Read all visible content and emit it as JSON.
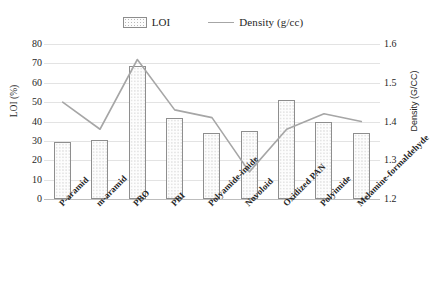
{
  "legend": {
    "position": "top-center",
    "entries": [
      {
        "label": "LOI",
        "type": "bar",
        "marker": "bar-swatch-icon"
      },
      {
        "label": "Density (g/cc)",
        "type": "line",
        "marker": "line-swatch-icon"
      }
    ]
  },
  "axes": {
    "left_title": "LOI (%)",
    "right_title": "Density (G/CC)",
    "left_ticks": [
      "80",
      "70",
      "60",
      "50",
      "40",
      "30",
      "20",
      "10",
      "0"
    ],
    "right_ticks": [
      "1.6",
      "1.5",
      "1.4",
      "1.3",
      "1.2"
    ]
  },
  "chart_data": {
    "type": "bar",
    "title": "",
    "xlabel": "",
    "ylabel": "LOI (%)",
    "y2label": "Density (G/CC)",
    "ylim": [
      0,
      80
    ],
    "y2lim": [
      1.2,
      1.6
    ],
    "grid": true,
    "legend_position": "top-center",
    "categories": [
      "P-aramid",
      "m-aramid",
      "PBO",
      "PBI",
      "Polyamide-imide",
      "Novoloid",
      "Oxidized PAN",
      "Polyimide",
      "Melamine-formaldehyde"
    ],
    "series": [
      {
        "name": "LOI",
        "type": "bar",
        "axis": "left",
        "unit": "%",
        "values": [
          29.5,
          30.5,
          68.5,
          42,
          34,
          35,
          51,
          40,
          34
        ]
      },
      {
        "name": "Density (g/cc)",
        "type": "line",
        "axis": "right",
        "unit": "g/cc",
        "values": [
          1.45,
          1.38,
          1.56,
          1.43,
          1.41,
          1.27,
          1.38,
          1.42,
          1.4
        ]
      }
    ]
  },
  "colors": {
    "bar_outline": "#8e8e8e",
    "bar_fill": "#fdfdfd",
    "line": "#a6a6a6",
    "gridline": "#e3e3e3",
    "text": "#262626"
  }
}
